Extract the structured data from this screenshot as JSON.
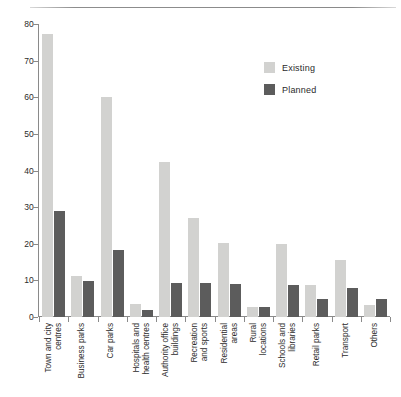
{
  "chart_data": {
    "type": "bar",
    "title": "",
    "xlabel": "",
    "ylabel": "",
    "ylim": [
      0,
      80
    ],
    "yticks": [
      0,
      10,
      20,
      30,
      40,
      50,
      60,
      70,
      80
    ],
    "grid": false,
    "legend_position": "top-right",
    "categories": [
      "Town and city centres",
      "Business parks",
      "Car parks",
      "Hospitals and health centres",
      "Authority office buildings",
      "Recreation and sports",
      "Residential areas",
      "Rural locations",
      "Schools and libraries",
      "Retail parks",
      "Transport",
      "Others"
    ],
    "category_lines": [
      [
        "Town and city",
        "centres"
      ],
      [
        "Business parks",
        ""
      ],
      [
        "Car parks",
        ""
      ],
      [
        "Hospitals and",
        "health centres"
      ],
      [
        "Authority office",
        "buildings"
      ],
      [
        "Recreation",
        "and sports"
      ],
      [
        "Residential",
        "areas"
      ],
      [
        "Rural",
        "locations"
      ],
      [
        "Schools and",
        "libraries"
      ],
      [
        "Retail parks",
        ""
      ],
      [
        "Transport",
        ""
      ],
      [
        "Others",
        ""
      ]
    ],
    "series": [
      {
        "name": "Existing",
        "color": "#d2d2d0",
        "values": [
          77.2,
          11.2,
          60.2,
          3.6,
          42.3,
          27.1,
          20.2,
          2.8,
          20.0,
          8.7,
          15.7,
          3.4
        ]
      },
      {
        "name": "Planned",
        "color": "#5c5c5c",
        "values": [
          28.9,
          9.9,
          18.3,
          2.0,
          9.2,
          9.4,
          9.0,
          2.8,
          8.8,
          5.0,
          8.0,
          5.0
        ]
      }
    ]
  },
  "legend": {
    "items": [
      {
        "label": "Existing",
        "color": "#d2d2d0"
      },
      {
        "label": "Planned",
        "color": "#5c5c5c"
      }
    ]
  }
}
